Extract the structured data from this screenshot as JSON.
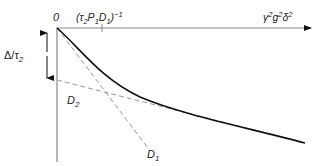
{
  "diagram": {
    "origin_label": "0",
    "x_tick_label": "(τ₂P₁D₁)⁻¹",
    "x_tick_parts": {
      "open": "(τ",
      "s1": "2",
      "p": "P",
      "s2": "1",
      "d": "D",
      "s3": "1",
      "close": ")",
      "exp": "−1"
    },
    "x_axis_label_parts": {
      "gamma": "γ",
      "e1": "2",
      "g": "g",
      "e2": "2",
      "delta": "δ",
      "e3": "2"
    },
    "x_axis_label": "γ²g²δ²",
    "y_arrow_label": "Δ/τ₂",
    "y_arrow_parts": {
      "main": "Δ/τ",
      "sub": "2"
    },
    "line_d1_label": {
      "main": "D",
      "sub": "1"
    },
    "line_d2_label": {
      "main": "D",
      "sub": "2"
    },
    "colors": {
      "axis": "#888888",
      "curve": "#111111",
      "dashed": "#999999",
      "text": "#222222"
    }
  }
}
